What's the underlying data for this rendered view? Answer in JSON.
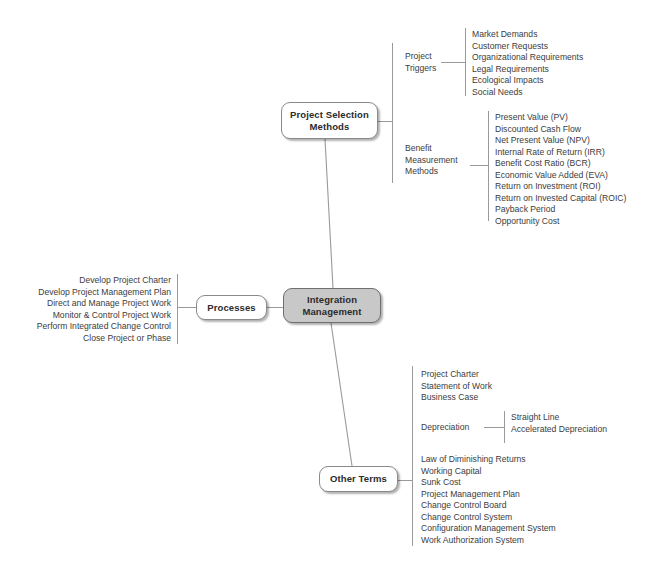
{
  "diagram": {
    "type": "mind-map",
    "colors": {
      "center_node_fill": "#c8c8c8",
      "node_fill": "#ffffff",
      "node_border": "#8a8a8a",
      "text": "#3c3c3c",
      "connector": "#9a9a9a",
      "background": "#ffffff"
    }
  },
  "nodes": {
    "center": {
      "label": "Integration\nManagement"
    },
    "project_selection_methods": {
      "label": "Project Selection\nMethods"
    },
    "processes": {
      "label": "Processes"
    },
    "other_terms": {
      "label": "Other Terms"
    }
  },
  "branches": {
    "project_triggers": {
      "caption": "Project\nTriggers",
      "items": [
        "Market Demands",
        "Customer Requests",
        "Organizational Requirements",
        "Legal Requirements",
        "Ecological Impacts",
        "Social Needs"
      ]
    },
    "benefit_measurement_methods": {
      "caption": "Benefit\nMeasurement\nMethods",
      "items": [
        "Present Value (PV)",
        "Discounted Cash Flow",
        "Net Present Value (NPV)",
        "Internal Rate of Return (IRR)",
        "Benefit Cost Ratio (BCR)",
        "Economic Value Added (EVA)",
        "Return on Investment (ROI)",
        "Return on Invested Capital (ROIC)",
        "Payback Period",
        "Opportunity Cost"
      ]
    },
    "processes_items": {
      "items": [
        "Develop Project Charter",
        "Develop Project Management Plan",
        "Direct and Manage Project Work",
        "Monitor & Control Project Work",
        "Perform Integrated Change Control",
        "Close Project or Phase"
      ]
    },
    "other_terms_documents": {
      "items": [
        "Project Charter",
        "Statement of Work",
        "Business Case"
      ]
    },
    "depreciation": {
      "caption": "Depreciation",
      "items": [
        "Straight Line",
        "Accelerated Depreciation"
      ]
    },
    "other_terms_concepts": {
      "items": [
        "Law of Diminishing Returns",
        "Working Capital",
        "Sunk Cost",
        "Project Management Plan",
        "Change Control Board",
        "Change Control System",
        "Configuration Management System",
        "Work Authorization System"
      ]
    }
  }
}
